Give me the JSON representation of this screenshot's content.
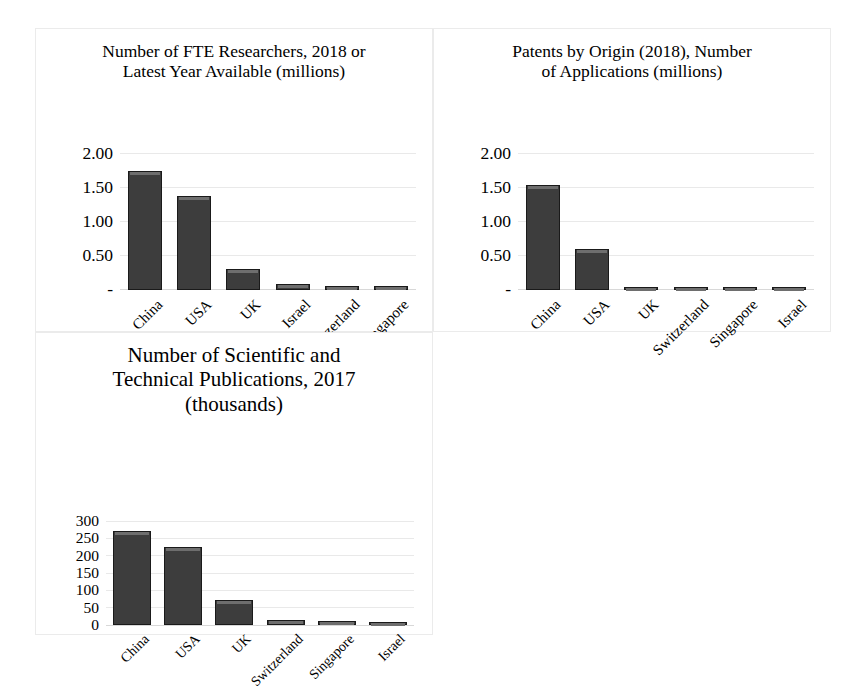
{
  "figure": {
    "panel_border_color": "#ebebeb",
    "bar_fill_color": "#3d3d3d",
    "bar_border_color": "#1a1a1a",
    "gridline_color": "#e9e9e9"
  },
  "chart_data": [
    {
      "id": "fte-researchers",
      "type": "bar",
      "title": "Number of FTE Researchers, 2018 or\nLatest Year Available (millions)",
      "xlabel": "",
      "ylabel": "",
      "categories": [
        "China",
        "USA",
        "UK",
        "Israel",
        "Switzerland",
        "Singapore"
      ],
      "values": [
        1.74,
        1.37,
        0.3,
        0.08,
        0.05,
        0.05
      ],
      "ylim": [
        0,
        2.0
      ],
      "yticks": [
        0,
        0.5,
        1.0,
        1.5,
        2.0
      ],
      "ytick_labels": [
        "-",
        "0.50",
        "1.00",
        "1.50",
        "2.00"
      ],
      "grid": true,
      "legend": "none"
    },
    {
      "id": "patents-by-origin",
      "type": "bar",
      "title": "Patents by Origin (2018), Number\nof Applications (millions)",
      "xlabel": "",
      "ylabel": "",
      "categories": [
        "China",
        "USA",
        "UK",
        "Switzerland",
        "Singapore",
        "Israel"
      ],
      "values": [
        1.54,
        0.6,
        0.02,
        0.005,
        0.004,
        0.003
      ],
      "ylim": [
        0,
        2.0
      ],
      "yticks": [
        0,
        0.5,
        1.0,
        1.5,
        2.0
      ],
      "ytick_labels": [
        "-",
        "0.50",
        "1.00",
        "1.50",
        "2.00"
      ],
      "grid": true,
      "legend": "none"
    },
    {
      "id": "scientific-publications",
      "type": "bar",
      "title": "Number of Scientific and\nTechnical Publications, 2017\n(thousands)",
      "xlabel": "",
      "ylabel": "",
      "categories": [
        "China",
        "USA",
        "UK",
        "Switzerland",
        "Singapore",
        "Israel"
      ],
      "values": [
        270,
        225,
        72,
        16,
        11,
        8
      ],
      "ylim": [
        0,
        300
      ],
      "yticks": [
        0,
        50,
        100,
        150,
        200,
        250,
        300
      ],
      "ytick_labels": [
        "0",
        "50",
        "100",
        "150",
        "200",
        "250",
        "300"
      ],
      "grid": true,
      "legend": "none"
    }
  ]
}
